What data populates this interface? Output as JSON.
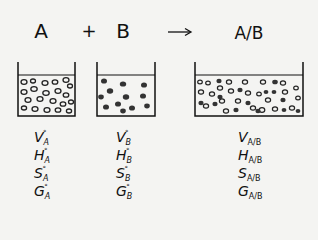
{
  "diagram": {
    "type": "mixing-schematic",
    "equation": {
      "left_component": "A",
      "operator": "+",
      "right_component": "B",
      "arrow": "→",
      "product": "A/B"
    },
    "beakers": [
      {
        "id": "A",
        "contents": "open circles (pure A particles)",
        "particle_style": "hollow"
      },
      {
        "id": "B",
        "contents": "filled dots (pure B particles)",
        "particle_style": "filled"
      },
      {
        "id": "A/B",
        "contents": "mixture of open circles and filled dots",
        "particle_style": "mixed"
      }
    ],
    "properties": {
      "A": [
        {
          "symbol": "V",
          "sup": "°",
          "sub": "A"
        },
        {
          "symbol": "H",
          "sup": "°",
          "sub": "A"
        },
        {
          "symbol": "S",
          "sup": "°",
          "sub": "A"
        },
        {
          "symbol": "G",
          "sup": "°",
          "sub": "A"
        }
      ],
      "B": [
        {
          "symbol": "V",
          "sup": "°",
          "sub": "B"
        },
        {
          "symbol": "H",
          "sup": "°",
          "sub": "B"
        },
        {
          "symbol": "S",
          "sup": "°",
          "sub": "B"
        },
        {
          "symbol": "G",
          "sup": "°",
          "sub": "B"
        }
      ],
      "AB": [
        {
          "symbol": "V",
          "sup": "",
          "sub": "A/B"
        },
        {
          "symbol": "H",
          "sup": "",
          "sub": "A/B"
        },
        {
          "symbol": "S",
          "sup": "",
          "sub": "A/B"
        },
        {
          "symbol": "G",
          "sup": "",
          "sub": "A/B"
        }
      ]
    },
    "colors": {
      "background": "#f4f4f2",
      "ink": "#111111",
      "filled_particle": "#333333"
    }
  }
}
